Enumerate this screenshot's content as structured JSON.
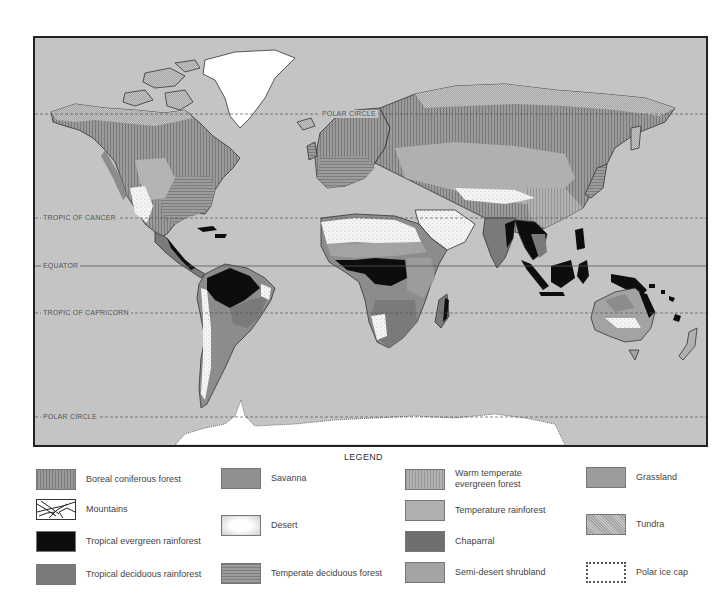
{
  "map": {
    "title": "World biomes",
    "ocean_color": "#c4c4c4",
    "latitude_lines": [
      {
        "label": "POLAR CIRCLE",
        "y": 76,
        "style": "dashed",
        "label_x": 285
      },
      {
        "label": "TROPIC OF CANCER",
        "y": 180,
        "style": "dashed",
        "label_x": 6
      },
      {
        "label": "EQUATOR",
        "y": 228,
        "style": "solid",
        "label_x": 6
      },
      {
        "label": "TROPIC OF CAPRICORN",
        "y": 275,
        "style": "dashed",
        "label_x": 6
      },
      {
        "label": "POLAR CIRCLE",
        "y": 379,
        "style": "dashed",
        "label_x": 6
      }
    ]
  },
  "legend": {
    "title": "LEGEND",
    "items": [
      {
        "label": "Boreal coniferous forest",
        "pattern": "vertical-stripes",
        "color": "#8a8a8a"
      },
      {
        "label": "Mountains",
        "pattern": "mountains",
        "color": "#ffffff"
      },
      {
        "label": "Tropical evergreen rainforest",
        "pattern": "solid",
        "color": "#0d0d0d"
      },
      {
        "label": "Tropical deciduous rainforest",
        "pattern": "solid",
        "color": "#7a7a7a"
      },
      {
        "label": "Savanna",
        "pattern": "solid",
        "color": "#8f8f8f"
      },
      {
        "label": "Desert",
        "pattern": "stipple",
        "color": "#f0f0f0"
      },
      {
        "label": "Temperate deciduous forest",
        "pattern": "horizontal-stripes",
        "color": "#8c8c8c"
      },
      {
        "label": "Warm temperate evergreen forest",
        "pattern": "vertical-stripes-light",
        "color": "#a8a8a8"
      },
      {
        "label": "Temperature rainforest",
        "pattern": "solid",
        "color": "#b0b0b0"
      },
      {
        "label": "Chaparral",
        "pattern": "solid",
        "color": "#6e6e6e"
      },
      {
        "label": "Semi-desert shrubland",
        "pattern": "solid",
        "color": "#a3a3a3"
      },
      {
        "label": "Grassland",
        "pattern": "solid",
        "color": "#9c9c9c"
      },
      {
        "label": "Tundra",
        "pattern": "crosshatch",
        "color": "#b8b8b8"
      },
      {
        "label": "Polar ice cap",
        "pattern": "ice",
        "color": "#ffffff"
      }
    ]
  }
}
